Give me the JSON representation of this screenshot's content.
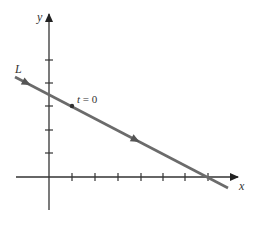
{
  "diagram": {
    "axes": {
      "x_label": "x",
      "y_label": "y",
      "origin": [
        49,
        177
      ],
      "x_ticks_px": [
        72,
        95,
        118,
        141,
        163,
        185,
        208
      ],
      "y_ticks_px": [
        60,
        83,
        106,
        130,
        153
      ]
    },
    "line": {
      "label": "L",
      "start": [
        15,
        77
      ],
      "end": [
        228,
        188
      ],
      "color": "#666666",
      "direction_arrows": [
        [
          27,
          83
        ],
        [
          135,
          140
        ]
      ]
    },
    "point": {
      "label_t": "t",
      "label_eq": " = 0",
      "position": [
        72,
        106
      ]
    },
    "colors": {
      "axis": "#333333",
      "line": "#6b6b6b"
    }
  }
}
